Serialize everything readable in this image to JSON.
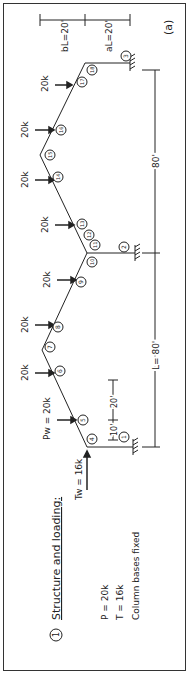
{
  "figure": {
    "label": "(a)",
    "section_number": "1",
    "title": "Structure and loading:",
    "notes": [
      "P = 20k",
      "T = 16k",
      "Column bases fixed"
    ]
  },
  "dimensions": {
    "bL": "bL=20'",
    "aL": "aL=20'",
    "span_upper": "80'",
    "span_lower": "L= 80'",
    "col_height_a": "10'",
    "col_height_b": "20'"
  },
  "loads": {
    "P_label": "20k",
    "Pw_label": "Pw = 20k",
    "Tw_label": "Tw = 16k"
  },
  "nodes": [
    "1",
    "2",
    "3",
    "4",
    "5",
    "6",
    "7",
    "8",
    "9",
    "10",
    "11",
    "12",
    "13",
    "14",
    "15",
    "16",
    "17",
    "18"
  ],
  "colors": {
    "line": "#222222",
    "background": "#ffffff",
    "border": "#333333"
  }
}
